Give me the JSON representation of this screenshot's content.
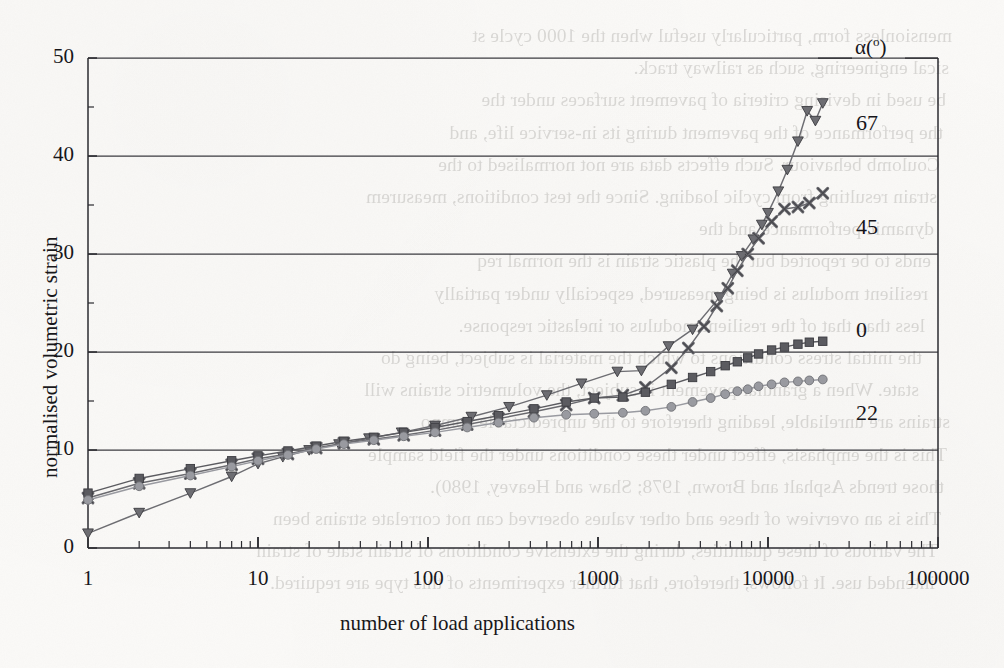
{
  "page": {
    "background_color": "#fbfaf8",
    "ink_color": "#2a2a2e"
  },
  "chart_data": {
    "type": "line",
    "title": "",
    "xlabel": "number of load applications",
    "ylabel": "normalised volumetric strain",
    "xscale": "log",
    "xlim": [
      1,
      100000
    ],
    "ylim": [
      0,
      50
    ],
    "yticks": [
      0,
      10,
      20,
      30,
      40,
      50
    ],
    "xticks": [
      1,
      10,
      100,
      1000,
      10000,
      100000
    ],
    "xtick_labels": [
      "1",
      "10",
      "100",
      "1000",
      "10000",
      "100000"
    ],
    "ytick_labels": [
      "0",
      "10",
      "20",
      "30",
      "40",
      "50"
    ],
    "grid": "horizontal-major",
    "legend_title": "α(°)",
    "legend_position": "right-inline",
    "series": [
      {
        "name": "67",
        "label": "67",
        "marker": "triangle-down",
        "color": "#6d6d72",
        "points": [
          [
            1,
            1.5
          ],
          [
            2,
            3.6
          ],
          [
            4,
            5.6
          ],
          [
            7,
            7.3
          ],
          [
            10,
            8.6
          ],
          [
            14,
            9.3
          ],
          [
            20,
            10.0
          ],
          [
            30,
            10.6
          ],
          [
            45,
            11.2
          ],
          [
            70,
            11.8
          ],
          [
            110,
            12.5
          ],
          [
            180,
            13.4
          ],
          [
            300,
            14.4
          ],
          [
            500,
            15.6
          ],
          [
            800,
            16.8
          ],
          [
            1300,
            18.0
          ],
          [
            1800,
            18.1
          ],
          [
            2600,
            20.6
          ],
          [
            3600,
            22.3
          ],
          [
            5200,
            25.6
          ],
          [
            6200,
            28.0
          ],
          [
            7000,
            29.8
          ],
          [
            8200,
            31.5
          ],
          [
            9200,
            33.0
          ],
          [
            10000,
            34.2
          ],
          [
            11500,
            36.4
          ],
          [
            13000,
            38.6
          ],
          [
            15000,
            41.5
          ],
          [
            17000,
            44.6
          ],
          [
            19000,
            43.6
          ],
          [
            21000,
            45.4
          ]
        ]
      },
      {
        "name": "45",
        "label": "45",
        "marker": "x-cross",
        "color": "#6a6a6f",
        "points": [
          [
            1,
            5.1
          ],
          [
            2,
            6.6
          ],
          [
            4,
            7.6
          ],
          [
            7,
            8.5
          ],
          [
            10,
            9.1
          ],
          [
            15,
            9.6
          ],
          [
            22,
            10.2
          ],
          [
            32,
            10.7
          ],
          [
            48,
            11.1
          ],
          [
            72,
            11.5
          ],
          [
            110,
            12.0
          ],
          [
            170,
            12.6
          ],
          [
            260,
            13.2
          ],
          [
            420,
            13.9
          ],
          [
            650,
            14.6
          ],
          [
            950,
            15.3
          ],
          [
            1400,
            15.6
          ],
          [
            1900,
            16.4
          ],
          [
            2700,
            18.4
          ],
          [
            3400,
            20.4
          ],
          [
            4200,
            22.6
          ],
          [
            5000,
            24.7
          ],
          [
            5800,
            26.5
          ],
          [
            6600,
            28.3
          ],
          [
            7600,
            30.0
          ],
          [
            8800,
            31.6
          ],
          [
            10500,
            33.3
          ],
          [
            12500,
            34.6
          ],
          [
            15000,
            34.8
          ],
          [
            17500,
            35.2
          ],
          [
            21000,
            36.2
          ]
        ]
      },
      {
        "name": "0",
        "label": "0",
        "marker": "square",
        "color": "#5b5b60",
        "points": [
          [
            1,
            5.6
          ],
          [
            2,
            7.1
          ],
          [
            4,
            8.1
          ],
          [
            7,
            8.9
          ],
          [
            10,
            9.4
          ],
          [
            15,
            9.9
          ],
          [
            22,
            10.4
          ],
          [
            32,
            10.9
          ],
          [
            48,
            11.3
          ],
          [
            72,
            11.8
          ],
          [
            110,
            12.3
          ],
          [
            170,
            12.9
          ],
          [
            260,
            13.5
          ],
          [
            420,
            14.2
          ],
          [
            650,
            14.9
          ],
          [
            950,
            15.3
          ],
          [
            1400,
            15.4
          ],
          [
            1900,
            15.9
          ],
          [
            2700,
            16.7
          ],
          [
            3600,
            17.4
          ],
          [
            4600,
            18.0
          ],
          [
            5600,
            18.6
          ],
          [
            6600,
            19.0
          ],
          [
            7600,
            19.4
          ],
          [
            8800,
            19.8
          ],
          [
            10500,
            20.2
          ],
          [
            12500,
            20.5
          ],
          [
            15000,
            20.8
          ],
          [
            17500,
            21.0
          ],
          [
            21000,
            21.1
          ]
        ]
      },
      {
        "name": "22",
        "label": "22",
        "marker": "circle",
        "color": "#999aa0",
        "points": [
          [
            1,
            4.9
          ],
          [
            2,
            6.3
          ],
          [
            4,
            7.4
          ],
          [
            7,
            8.3
          ],
          [
            10,
            8.9
          ],
          [
            15,
            9.5
          ],
          [
            22,
            10.1
          ],
          [
            32,
            10.6
          ],
          [
            48,
            11.0
          ],
          [
            72,
            11.4
          ],
          [
            110,
            11.8
          ],
          [
            170,
            12.3
          ],
          [
            260,
            12.8
          ],
          [
            420,
            13.3
          ],
          [
            650,
            13.6
          ],
          [
            950,
            13.7
          ],
          [
            1400,
            13.8
          ],
          [
            1900,
            14.0
          ],
          [
            2700,
            14.4
          ],
          [
            3600,
            14.9
          ],
          [
            4600,
            15.3
          ],
          [
            5600,
            15.7
          ],
          [
            6600,
            16.0
          ],
          [
            7600,
            16.2
          ],
          [
            8800,
            16.5
          ],
          [
            10500,
            16.7
          ],
          [
            12500,
            16.9
          ],
          [
            15000,
            17.0
          ],
          [
            17500,
            17.1
          ],
          [
            21000,
            17.2
          ]
        ]
      }
    ]
  },
  "legend_labels": {
    "title": "α(°)",
    "items": [
      "67",
      "45",
      "0",
      "22"
    ]
  },
  "bleed_through_lines": [
    "mensionless form, particularly useful when the 1000 cycle st",
    "sical engineering, such as railway track.",
    "be used in devising criteria of pavement surfaces under the",
    "the performance of the pavement during its in-service life, and",
    "Coulomb behaviour. Such effects data are not normalised to the",
    "strain resulting from cyclic loading. Since the test conditions, measurem",
    "dynamic performance and the",
    "ends to be reported but the plastic strain is the normal req",
    "resilient modulus is being measured, especially under partially",
    "less than that of the resilient modulus or inelastic response.",
    "the initial stress conditions to which the material is subject, being do",
    "state. When a granular pavement is subject, the volumetric strains will",
    "strains are unreliable, leading therefore to the unpredictable compo",
    "This is the emphasis, effect under these conditions under the field sample",
    "those trends Asphalt and Brown, 1978; Shaw and Heavey, 1980).",
    "This is an overview of these and other values observed can not correlate strains been",
    "The various of these quantities, during the extensive conditions of strain state of strain",
    "intended use. It follows, therefore, that further experiments of this type are required."
  ]
}
